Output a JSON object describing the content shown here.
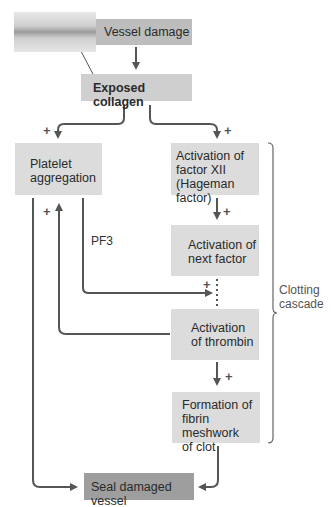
{
  "diagram": {
    "nodes": {
      "vessel_damage": "Vessel damage",
      "exposed_collagen": "Exposed collagen",
      "platelet_aggregation_line1": "Platelet",
      "platelet_aggregation_line2": "aggregation",
      "factor_xii_line1": "Activation of",
      "factor_xii_line2": "factor XII",
      "factor_xii_line3": "(Hageman factor)",
      "next_factor_line1": "Activation of",
      "next_factor_line2": "next factor",
      "thrombin_line1": "Activation",
      "thrombin_line2": "of thrombin",
      "fibrin_line1": "Formation of",
      "fibrin_line2": "fibrin meshwork",
      "fibrin_line3": "of clot",
      "seal": "Seal damaged vessel"
    },
    "labels": {
      "pf3": "PF3",
      "cascade_line1": "Clotting",
      "cascade_line2": "cascade",
      "plus": "+"
    },
    "colors": {
      "light_box": "#dcdcdc",
      "dark_box": "#9e9e9e",
      "mid_box": "#bdbdbd",
      "arrow": "#555555"
    }
  }
}
